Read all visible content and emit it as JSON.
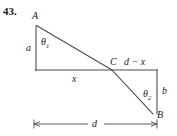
{
  "figure": {
    "problem_number": "43.",
    "type": "geometry-diagram",
    "stroke_color": "#4d4d4d",
    "text_color": "#1a1a1a",
    "background_color": "#ffffff",
    "vertices": {
      "A": "A",
      "B": "B",
      "C": "C"
    },
    "segment_labels": {
      "a": "a",
      "b": "b",
      "x": "x",
      "d_minus_x": "d − x",
      "d": "d"
    },
    "angle_labels": {
      "theta1": "θ",
      "theta1_sub": "1",
      "theta2": "θ",
      "theta2_sub": "2"
    },
    "geometry": {
      "A": [
        36,
        25
      ],
      "A_foot": [
        36,
        70
      ],
      "C": [
        112,
        70
      ],
      "B": [
        152,
        113
      ],
      "B_foot": [
        157,
        70
      ],
      "baseline_left": [
        35,
        70
      ],
      "baseline_right": [
        157,
        70
      ],
      "dimension_y": 124,
      "dimension_left_x": 34,
      "dimension_right_x": 157
    }
  }
}
